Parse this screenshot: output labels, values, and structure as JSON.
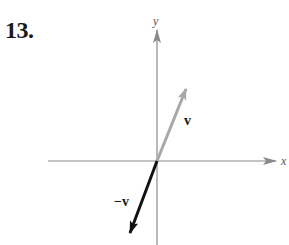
{
  "problem": {
    "number": "13."
  },
  "axes": {
    "x_label": "x",
    "y_label": "y",
    "color": "#8a8a8a"
  },
  "vectors": [
    {
      "name": "v",
      "label": "v",
      "color": "#a8a8a8",
      "direction": "up-right"
    },
    {
      "name": "neg-v",
      "label": "−v",
      "color": "#111111",
      "direction": "down-left"
    }
  ]
}
